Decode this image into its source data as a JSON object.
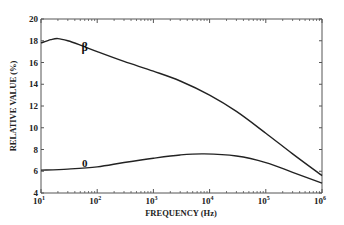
{
  "chart_data": {
    "type": "line",
    "title": "",
    "xlabel": "FREQUENCY (Hz)",
    "ylabel": "RELATIVE VALUE (%)",
    "xscale": "log",
    "xlim": [
      10,
      1000000
    ],
    "ylim": [
      4,
      20
    ],
    "grid": false,
    "legend": "none",
    "x_ticks": [
      {
        "value": 10,
        "base": "10",
        "exp": "1"
      },
      {
        "value": 100,
        "base": "10",
        "exp": "2"
      },
      {
        "value": 1000,
        "base": "10",
        "exp": "3"
      },
      {
        "value": 10000,
        "base": "10",
        "exp": "4"
      },
      {
        "value": 100000,
        "base": "10",
        "exp": "5"
      },
      {
        "value": 1000000,
        "base": "10",
        "exp": "6"
      }
    ],
    "y_ticks": [
      4,
      6,
      8,
      10,
      12,
      14,
      16,
      18,
      20
    ],
    "series": [
      {
        "name": "β",
        "label": "β",
        "label_at": {
          "x": 60,
          "y": 17.1
        },
        "x": [
          10,
          15,
          20,
          30,
          50,
          100,
          300,
          1000,
          3000,
          10000,
          30000,
          100000,
          300000,
          1000000
        ],
        "y": [
          17.8,
          18.1,
          18.2,
          18.0,
          17.6,
          17.0,
          16.1,
          15.2,
          14.3,
          13.0,
          11.5,
          9.5,
          7.6,
          5.6
        ]
      },
      {
        "name": "0",
        "label": "0",
        "label_at": {
          "x": 60,
          "y": 6.4
        },
        "x": [
          10,
          30,
          100,
          300,
          1000,
          3000,
          8000,
          30000,
          100000,
          300000,
          1000000
        ],
        "y": [
          6.1,
          6.2,
          6.4,
          6.8,
          7.2,
          7.5,
          7.6,
          7.4,
          6.8,
          5.9,
          4.9
        ]
      }
    ]
  },
  "colors": {
    "line": "#222222",
    "axis": "#555555"
  }
}
